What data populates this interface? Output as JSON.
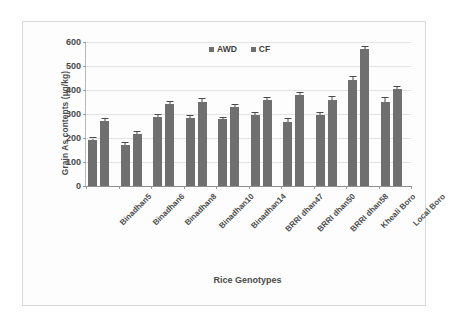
{
  "chart_data": {
    "type": "bar",
    "title": "",
    "xlabel": "Rice Genotypes",
    "ylabel": "Grain As contents (µg/kg)",
    "categories": [
      "Binadhan5",
      "Binadhan6",
      "Binadhan8",
      "Binadhan10",
      "Binadhan14",
      "BRRI dhan47",
      "BRRI dhan50",
      "BRRI dhan58",
      "Kheali Boro",
      "Local Boro"
    ],
    "series": [
      {
        "name": "AWD",
        "values": [
          190,
          170,
          288,
          285,
          278,
          295,
          268,
          296,
          443,
          352
        ],
        "errors": [
          8,
          8,
          9,
          8,
          6,
          9,
          10,
          10,
          10,
          13
        ]
      },
      {
        "name": "CF",
        "values": [
          272,
          215,
          343,
          352,
          328,
          358,
          378,
          359,
          570,
          405
        ],
        "errors": [
          9,
          10,
          8,
          12,
          8,
          9,
          8,
          11,
          11,
          7
        ]
      }
    ],
    "legend": [
      "AWD",
      "CF"
    ],
    "legend_position": "top-center",
    "ylim": [
      0,
      600
    ],
    "yticks": [
      0,
      100,
      200,
      300,
      400,
      500,
      600
    ],
    "ytick_labels": [
      "0",
      "100",
      "200",
      "300",
      "400",
      "500",
      "600"
    ],
    "grid": true,
    "bar_color": "#6f6f6f"
  }
}
